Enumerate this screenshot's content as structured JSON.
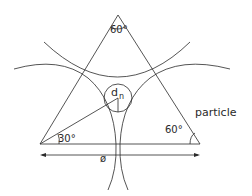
{
  "diagram": {
    "type": "geometry",
    "labels": {
      "apex_angle": "60°",
      "right_angle": "60°",
      "left_angle": "30°",
      "pore_diameter": "d",
      "pore_subscript": "n",
      "particle": "particle",
      "diameter_symbol": "ø"
    },
    "colors": {
      "stroke": "#2a2a2a",
      "background": "#ffffff"
    }
  }
}
